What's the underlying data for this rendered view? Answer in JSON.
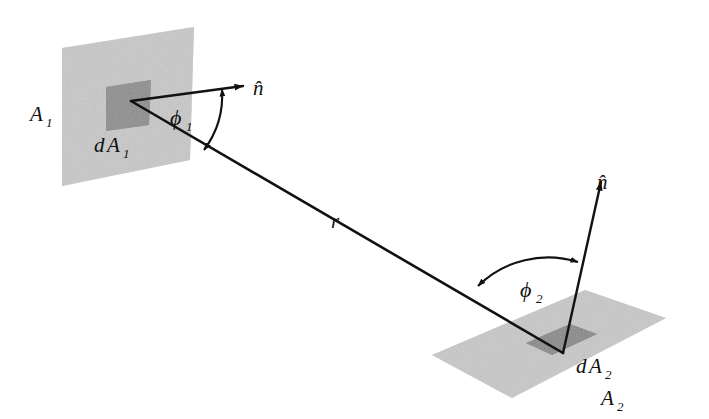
{
  "figure": {
    "background_color": "#ffffff",
    "stroke_color": "#111111",
    "plane_fill": "#cfcfcf",
    "patch_fill": "#8f8f8f",
    "plane_noise_fill": "#c4c4c4"
  },
  "labels": {
    "area_1": "A",
    "area_1_sub": "1",
    "darea_1_d": "d",
    "darea_1_A": "A",
    "darea_1_sub": "1",
    "normal_1": "n̂",
    "phi_1": "ϕ",
    "phi_1_sub": "1",
    "distance_r": "r",
    "normal_2": "n̂",
    "phi_2": "ϕ",
    "phi_2_sub": "2",
    "darea_2_d": "d",
    "darea_2_A": "A",
    "darea_2_sub": "2",
    "area_2": "A",
    "area_2_sub": "2"
  },
  "geometry": {
    "plane_1": {
      "points": "62,48 194,27 190,160 62,186",
      "description": "large tilted rectangle representing surface A1"
    },
    "patch_1": {
      "points": "106,87 151,80 149,125 106,131",
      "description": "dark differential element dA1 on surface A1"
    },
    "plane_2": {
      "points": "432,355 585,290 666,318 512,398",
      "description": "large tilted rectangle representing surface A2"
    },
    "patch_2": {
      "points": "526,343 570,324 597,334 552,355",
      "description": "dark differential element dA2 on surface A2"
    },
    "normal_arrow_1": {
      "x1": 131,
      "y1": 101,
      "x2": 246,
      "y2": 86
    },
    "normal_arrow_2": {
      "x1": 563,
      "y1": 353,
      "x2": 603,
      "y2": 177
    },
    "ray_r": {
      "x1": 131,
      "y1": 101,
      "x2": 563,
      "y2": 353
    },
    "arc_phi_1": {
      "cx": 131,
      "cy": 101,
      "r": 92,
      "note": "double-headed arc between n-hat and r"
    },
    "arc_phi_2": {
      "cx": 563,
      "cy": 353,
      "r": 96,
      "note": "double-headed arc between r and n-hat"
    }
  },
  "label_positions": {
    "area_1": {
      "x": 30,
      "y": 121
    },
    "darea_1": {
      "x": 94,
      "y": 152
    },
    "normal_1": {
      "x": 253,
      "y": 94
    },
    "phi_1": {
      "x": 172,
      "y": 124
    },
    "distance_r": {
      "x": 331,
      "y": 227
    },
    "normal_2": {
      "x": 597,
      "y": 188
    },
    "phi_2": {
      "x": 523,
      "y": 296
    },
    "darea_2": {
      "x": 578,
      "y": 372
    },
    "area_2": {
      "x": 601,
      "y": 404
    }
  }
}
